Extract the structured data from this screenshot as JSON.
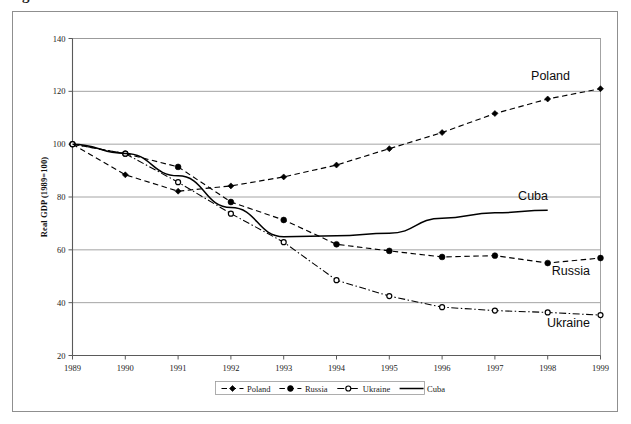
{
  "figure": {
    "clipped_caption": "g",
    "background_color": "#ffffff",
    "frame_color": "#8f8f8f"
  },
  "chart_data": {
    "type": "line",
    "title": "",
    "subtitle": "",
    "xlabel": "",
    "ylabel": "Real GDP (1989=100)",
    "x": [
      1989,
      1990,
      1991,
      1992,
      1993,
      1994,
      1995,
      1996,
      1997,
      1998,
      1999
    ],
    "categories": [
      "1989",
      "1990",
      "1991",
      "1992",
      "1993",
      "1994",
      "1995",
      "1996",
      "1997",
      "1998",
      "1999"
    ],
    "xlim": [
      1989,
      1999
    ],
    "ylim": [
      20,
      140
    ],
    "yticks": [
      20,
      40,
      60,
      80,
      100,
      120,
      140
    ],
    "ytick_labels": [
      "20",
      "40",
      "60",
      "80",
      "100",
      "120",
      "140"
    ],
    "grid": "horizontal",
    "legend_position": "bottom-center",
    "series": [
      {
        "name": "Poland",
        "marker": "diamond-filled",
        "linestyle": "dashed",
        "color": "#000000",
        "values": [
          100,
          88.4,
          82.2,
          84.2,
          87.6,
          92.1,
          98.3,
          104.4,
          111.6,
          117.1,
          121.0
        ],
        "annotation": "Poland"
      },
      {
        "name": "Russia",
        "marker": "circle-filled",
        "linestyle": "dashed",
        "color": "#000000",
        "values": [
          100,
          96.4,
          91.4,
          78.1,
          71.3,
          62.1,
          59.6,
          57.3,
          57.8,
          55.0,
          56.9
        ],
        "annotation": "Russia"
      },
      {
        "name": "Ukraine",
        "marker": "circle-open",
        "linestyle": "dash-dot",
        "color": "#000000",
        "values": [
          100,
          96.4,
          85.6,
          73.7,
          62.9,
          48.5,
          42.5,
          38.3,
          37.0,
          36.3,
          35.3
        ],
        "annotation": "Ukraine"
      },
      {
        "name": "Cuba",
        "marker": "none",
        "linestyle": "solid",
        "color": "#000000",
        "values": [
          100,
          96.5,
          88.0,
          76.0,
          65.0,
          65.3,
          66.3,
          72.0,
          74.0,
          75.0,
          null
        ],
        "annotation": "Cuba"
      }
    ],
    "legend_entries": [
      "Poland",
      "Russia",
      "Ukraine",
      "Cuba"
    ]
  }
}
